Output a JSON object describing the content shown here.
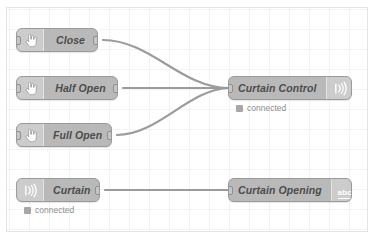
{
  "canvas": {
    "background_color": "#ffffff",
    "border_color": "#e4e4e4",
    "grid": "on"
  },
  "theme": {
    "node_fill": "#b9b9b9",
    "node_border": "#9a9a9a",
    "node_text": "#4c4c4c",
    "wire_color": "#9b9b9b",
    "status_text": "#8d8d8d"
  },
  "nodes": [
    {
      "id": "close",
      "label": "Close",
      "icon": "inject-hand-icon",
      "icon_side": "left",
      "type": "inject",
      "x": 16,
      "y": 28,
      "w": 82,
      "has_input": true,
      "has_output": true,
      "status": null
    },
    {
      "id": "half-open",
      "label": "Half Open",
      "icon": "inject-hand-icon",
      "icon_side": "left",
      "type": "inject",
      "x": 16,
      "y": 76,
      "w": 102,
      "has_input": true,
      "has_output": true,
      "status": null
    },
    {
      "id": "full-open",
      "label": "Full Open",
      "icon": "inject-hand-icon",
      "icon_side": "left",
      "type": "inject",
      "x": 16,
      "y": 123,
      "w": 96,
      "has_input": true,
      "has_output": true,
      "status": null
    },
    {
      "id": "curtain",
      "label": "Curtain",
      "icon": "mqtt-signal-icon",
      "icon_side": "left",
      "type": "mqtt-in",
      "x": 16,
      "y": 178,
      "w": 84,
      "has_input": false,
      "has_output": true,
      "status": "connected"
    },
    {
      "id": "curtain-control",
      "label": "Curtain Control",
      "icon": "mqtt-signal-icon",
      "icon_side": "right",
      "type": "mqtt-out",
      "x": 228,
      "y": 76,
      "w": 124,
      "has_input": true,
      "has_output": false,
      "status": "connected"
    },
    {
      "id": "curtain-opening",
      "label": "Curtain Opening",
      "icon": "debug-abc-icon",
      "icon_side": "right",
      "type": "debug",
      "x": 228,
      "y": 178,
      "w": 124,
      "has_input": true,
      "has_output": false,
      "status": null
    }
  ],
  "status_labels": {
    "connected": "connected"
  },
  "icons": {
    "debug_abc_text": "abc"
  },
  "wires": [
    {
      "from": "close",
      "to": "curtain-control",
      "path": "M 103 40 C 150 40 182 88 228 88"
    },
    {
      "from": "half-open",
      "to": "curtain-control",
      "path": "M 123 88 C 160 88 195 88 228 88"
    },
    {
      "from": "full-open",
      "to": "curtain-control",
      "path": "M 117 135 C 158 135 188 90 228 88"
    },
    {
      "from": "curtain",
      "to": "curtain-opening",
      "path": "M 105 190 C 150 190 190 190 228 190"
    }
  ]
}
